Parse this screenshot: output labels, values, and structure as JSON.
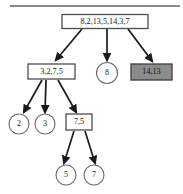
{
  "figure": {
    "type": "tree-diagram",
    "top_rule_color": "#8a8a8a",
    "box_border_color": "#4d4d4d",
    "circle_border_color": "#6b6b6b",
    "edge_color": "#1a1a1a",
    "shaded_fill": "#8c8c8c",
    "plain_fill": "#ffffff",
    "background": "#ffffff"
  },
  "nodes": [
    {
      "id": "root",
      "label": "8,2,13,5,14,3,7",
      "shape": "rect",
      "shaded": false,
      "x": 105,
      "y": 21.5,
      "w": 86,
      "h": 14
    },
    {
      "id": "n-left",
      "label": "3,2,7,5",
      "shape": "rect",
      "shaded": false,
      "x": 51.5,
      "y": 71.5,
      "w": 47,
      "h": 15
    },
    {
      "id": "n-mid",
      "label": "8",
      "shape": "circle",
      "shaded": false,
      "x": 107,
      "y": 73,
      "r": 10.5
    },
    {
      "id": "n-right",
      "label": "14,13",
      "shape": "rect",
      "shaded": true,
      "x": 151.5,
      "y": 72,
      "w": 41,
      "h": 16
    },
    {
      "id": "n-2",
      "label": "2",
      "shape": "circle",
      "shaded": false,
      "x": 19,
      "y": 124,
      "r": 10
    },
    {
      "id": "n-3",
      "label": "3",
      "shape": "circle",
      "shaded": false,
      "x": 45,
      "y": 124,
      "r": 10
    },
    {
      "id": "n-75",
      "label": "7,5",
      "shape": "rect",
      "shaded": false,
      "x": 79,
      "y": 122,
      "w": 26,
      "h": 16
    },
    {
      "id": "n-5",
      "label": "5",
      "shape": "circle",
      "shaded": false,
      "x": 66,
      "y": 175,
      "r": 10
    },
    {
      "id": "n-7",
      "label": "7",
      "shape": "circle",
      "shaded": false,
      "x": 94,
      "y": 175,
      "r": 10
    }
  ],
  "edges": [
    {
      "id": "e-root-left",
      "from": "root",
      "to": "n-left",
      "x1": 82,
      "y1": 29,
      "x2": 56,
      "y2": 60
    },
    {
      "id": "e-root-mid",
      "from": "root",
      "to": "n-mid",
      "x1": 107,
      "y1": 29,
      "x2": 107,
      "y2": 60
    },
    {
      "id": "e-root-right",
      "from": "root",
      "to": "n-right",
      "x1": 128,
      "y1": 29,
      "x2": 152,
      "y2": 61
    },
    {
      "id": "e-left-2",
      "from": "n-left",
      "to": "n-2",
      "x1": 42,
      "y1": 80,
      "x2": 24,
      "y2": 112
    },
    {
      "id": "e-left-3",
      "from": "n-left",
      "to": "n-3",
      "x1": 46,
      "y1": 80,
      "x2": 45,
      "y2": 112
    },
    {
      "id": "e-left-75",
      "from": "n-left",
      "to": "n-75",
      "x1": 58,
      "y1": 80,
      "x2": 76,
      "y2": 112
    },
    {
      "id": "e-75-5",
      "from": "n-75",
      "to": "n-5",
      "x1": 74,
      "y1": 131,
      "x2": 64,
      "y2": 163
    },
    {
      "id": "e-75-7",
      "from": "n-75",
      "to": "n-7",
      "x1": 85,
      "y1": 131,
      "x2": 95,
      "y2": 163
    }
  ],
  "top_rule": {
    "x1": 10,
    "x2": 180,
    "y": 6
  }
}
